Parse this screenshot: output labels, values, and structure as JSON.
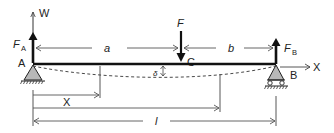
{
  "diagram": {
    "colors": {
      "line": "#222222",
      "dim_line": "#555555",
      "support_fill": "#b8b8b8",
      "background": "#ffffff"
    },
    "labels": {
      "w_axis": "W",
      "x_axis": "X",
      "reaction_a": "F",
      "reaction_a_sub": "A",
      "reaction_b": "F",
      "reaction_b_sub": "B",
      "point_a": "A",
      "point_b": "B",
      "point_c": "C",
      "load": "F",
      "dim_a": "a",
      "dim_b": "b",
      "dim_x": "X",
      "dim_l": "l",
      "deflection": "δ"
    },
    "elements": {
      "beam": "horizontal beam from A to B",
      "support_a": "pinned support (triangle on hatched ground)",
      "support_b": "roller support (triangle on rollers, hatched ground)",
      "load_arrow": "downward point load F at C",
      "deflection_curve": "dashed deflected shape"
    }
  }
}
